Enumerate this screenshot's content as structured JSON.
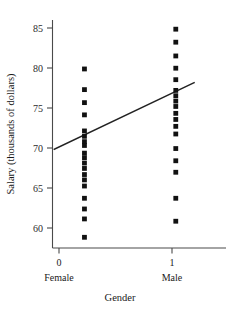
{
  "chart_data": {
    "type": "scatter",
    "title": "",
    "xlabel": "Gender",
    "ylabel": "Salary (thousands of dollars)",
    "xlim": [
      -0.35,
      1.55
    ],
    "ylim": [
      57.0,
      86.8
    ],
    "grid": false,
    "legend": null,
    "x_tick_values": [
      0,
      1
    ],
    "x_tick_labels": [
      "0",
      "1"
    ],
    "x_category_labels": [
      "Female",
      "Male"
    ],
    "y_tick_values": [
      60,
      65,
      70,
      75,
      80,
      85
    ],
    "y_tick_labels": [
      "60",
      "65",
      "70",
      "75",
      "80",
      "85"
    ],
    "series": [
      {
        "name": "Female",
        "x": 0,
        "values": [
          80.4,
          77.7,
          76.0,
          74.4,
          72.3,
          71.6,
          70.9,
          70.4,
          69.4,
          68.8,
          68.1,
          67.4,
          66.6,
          65.9,
          65.1,
          63.5,
          62.1,
          60.8,
          58.4
        ]
      },
      {
        "name": "Male",
        "x": 1,
        "values": [
          85.6,
          83.9,
          82.1,
          80.5,
          79.0,
          77.6,
          76.9,
          76.2,
          75.5,
          74.6,
          73.8,
          72.9,
          71.9,
          70.0,
          68.4,
          66.9,
          63.5,
          60.5
        ]
      }
    ],
    "fit_line": {
      "name": "least-squares regression line",
      "x_start": -0.33,
      "y_start": 69.9,
      "x_end": 1.2,
      "y_end": 78.6
    },
    "bottom_caption": ""
  }
}
